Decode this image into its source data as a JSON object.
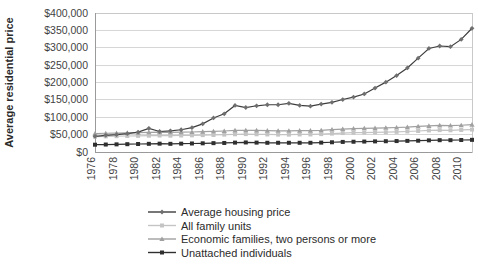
{
  "chart_data": {
    "type": "line",
    "title": "",
    "xlabel": "",
    "ylabel": "Average residential price",
    "ylim": [
      0,
      400000
    ],
    "ytick_step": 50000,
    "ytick_labels": [
      "$0",
      "$50,000",
      "$100,000",
      "$150,000",
      "$200,000",
      "$250,000",
      "$300,000",
      "$350,000",
      "$400,000"
    ],
    "ytick_values": [
      0,
      50000,
      100000,
      150000,
      200000,
      250000,
      300000,
      350000,
      400000
    ],
    "grid": true,
    "legend_position": "bottom",
    "x_tick_labels": [
      "1976",
      "1978",
      "1980",
      "1982",
      "1984",
      "1986",
      "1988",
      "1990",
      "1992",
      "1994",
      "1996",
      "1998",
      "2000",
      "2002",
      "2004",
      "2006",
      "2008",
      "2010"
    ],
    "x_tick_rotation": 90,
    "x": [
      1976,
      1977,
      1978,
      1979,
      1980,
      1981,
      1982,
      1983,
      1984,
      1985,
      1986,
      1987,
      1988,
      1989,
      1990,
      1991,
      1992,
      1993,
      1994,
      1995,
      1996,
      1997,
      1998,
      1999,
      2000,
      2001,
      2002,
      2003,
      2004,
      2005,
      2006,
      2007,
      2008,
      2009,
      2010,
      2011
    ],
    "series": [
      {
        "name": "Average housing price",
        "color": "#3d3d3d",
        "marker": "diamond",
        "marker_color": "#6f6f6f",
        "values": [
          45000,
          48000,
          50000,
          53000,
          57000,
          68000,
          59000,
          61000,
          64000,
          70000,
          81000,
          98000,
          110000,
          134000,
          128000,
          133000,
          136000,
          136000,
          140000,
          134000,
          132000,
          138000,
          143000,
          151000,
          158000,
          167000,
          184000,
          201000,
          220000,
          242000,
          270000,
          298000,
          305000,
          303000,
          324000,
          356000
        ]
      },
      {
        "name": "All family units",
        "color": "#c4c4c4",
        "marker": "square",
        "marker_color": "#c4c4c4",
        "values": [
          44000,
          45000,
          45500,
          46000,
          46500,
          47000,
          47500,
          47000,
          47500,
          48000,
          48500,
          49000,
          50000,
          51000,
          51500,
          51000,
          50500,
          50000,
          50000,
          50500,
          50500,
          51500,
          53000,
          54500,
          55500,
          56000,
          56500,
          57000,
          58000,
          59000,
          60500,
          62000,
          63000,
          62500,
          63500,
          64500
        ]
      },
      {
        "name": "Economic families, two persons or more",
        "color": "#a0a0a0",
        "marker": "triangle",
        "marker_color": "#a0a0a0",
        "values": [
          53000,
          54000,
          54500,
          55000,
          55500,
          56500,
          57000,
          56500,
          57000,
          57500,
          58500,
          59500,
          60500,
          62000,
          62500,
          62000,
          61500,
          61000,
          61000,
          61500,
          61500,
          62500,
          64500,
          66000,
          67500,
          68000,
          68500,
          69500,
          70500,
          71500,
          73500,
          75000,
          76500,
          76000,
          77000,
          78500
        ]
      },
      {
        "name": "Unattached individuals",
        "color": "#2f2f2f",
        "marker": "square",
        "marker_color": "#2f2f2f",
        "values": [
          21000,
          21500,
          22000,
          22500,
          23000,
          23500,
          24000,
          23500,
          24000,
          24500,
          25000,
          25500,
          26000,
          27000,
          27500,
          27000,
          26500,
          26500,
          26500,
          26500,
          26500,
          27000,
          28000,
          29000,
          29500,
          30000,
          30500,
          31000,
          31500,
          32000,
          32500,
          33500,
          34000,
          34000,
          34500,
          35000
        ]
      }
    ]
  }
}
